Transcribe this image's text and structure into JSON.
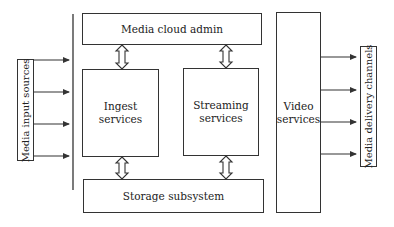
{
  "diagram": {
    "left_label": "Media input sources",
    "right_label": "Media delivery channels",
    "nodes": {
      "admin": "Media cloud admin",
      "ingest": "Ingest services",
      "streaming_line1": "Streaming",
      "streaming_line2": "services",
      "storage": "Storage subsystem",
      "video_line1": "Video",
      "video_line2": "services"
    },
    "edges": [
      {
        "from": "admin",
        "to": "ingest",
        "type": "bidirectional"
      },
      {
        "from": "admin",
        "to": "streaming",
        "type": "bidirectional"
      },
      {
        "from": "ingest",
        "to": "storage",
        "type": "bidirectional"
      },
      {
        "from": "streaming",
        "to": "storage",
        "type": "bidirectional"
      },
      {
        "from": "media-input-sources",
        "to": "platform",
        "count": 4
      },
      {
        "from": "video",
        "to": "media-delivery-channels",
        "count": 4
      }
    ],
    "colors": {
      "stroke": "#333333",
      "background": "#ffffff"
    }
  }
}
